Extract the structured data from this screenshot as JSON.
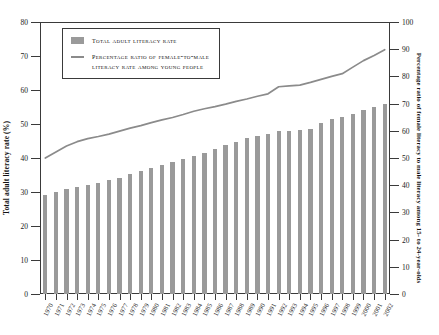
{
  "chart_data": {
    "type": "bar",
    "title": "",
    "subtitle": "",
    "xlabel": "",
    "ylabel": "Total adult literacy rate (%)",
    "ylabel_right": "Percentage ratio of female literacy to male literacy among 15- to 24-year-olds",
    "ylim": [
      0,
      80
    ],
    "ylim_right": [
      0,
      100
    ],
    "yticks": [
      0,
      10,
      20,
      30,
      40,
      50,
      60,
      70,
      80
    ],
    "yticks_right": [
      0,
      10,
      20,
      30,
      40,
      50,
      60,
      70,
      80,
      90,
      100
    ],
    "grid": false,
    "legend_position": "top-left",
    "categories": [
      "1970",
      "1971",
      "1972",
      "1973",
      "1974",
      "1975",
      "1976",
      "1977",
      "1978",
      "1979",
      "1980",
      "1981",
      "1982",
      "1983",
      "1984",
      "1985",
      "1986",
      "1987",
      "1988",
      "1989",
      "1990",
      "1991",
      "1992",
      "1993",
      "1994",
      "1995",
      "1996",
      "1997",
      "1998",
      "1999",
      "2000",
      "2001",
      "2002"
    ],
    "series": [
      {
        "name": "Total adult literacy rate",
        "type": "bar",
        "axis": "left",
        "color": "#9a9a9a",
        "values": [
          29.0,
          30.0,
          30.8,
          31.4,
          32.0,
          32.6,
          33.6,
          34.2,
          35.2,
          36.2,
          37.0,
          38.0,
          38.8,
          39.8,
          40.6,
          41.4,
          42.6,
          43.8,
          44.8,
          45.8,
          46.4,
          47.0,
          47.8,
          48.0,
          48.2,
          48.4,
          50.2,
          51.4,
          52.0,
          53.0,
          54.0,
          55.0,
          56.0
        ]
      },
      {
        "name": "Percentage ratio of female-to-male literacy rate among young people",
        "type": "line",
        "axis": "right",
        "color": "#8b8b8b",
        "values": [
          50.0,
          52.2,
          54.4,
          56.0,
          57.1,
          57.9,
          58.8,
          59.9,
          61.0,
          61.9,
          63.0,
          64.0,
          64.9,
          66.0,
          67.2,
          68.1,
          68.9,
          69.8,
          70.8,
          71.7,
          72.7,
          73.6,
          76.2,
          76.5,
          76.8,
          77.8,
          78.9,
          80.0,
          81.0,
          83.4,
          85.8,
          87.7,
          89.8
        ]
      }
    ]
  },
  "legend": {
    "items": [
      {
        "label": "Total adult literacy rate",
        "label_line2": "",
        "marker": "bar-swatch"
      },
      {
        "label": "Percentage ratio of female-to-male",
        "label_line2": "literacy rate among young people",
        "marker": "line-swatch"
      }
    ]
  }
}
